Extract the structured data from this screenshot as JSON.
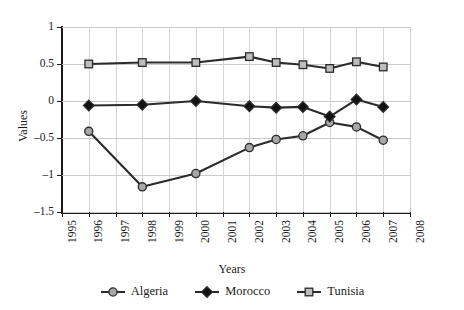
{
  "chart_data": {
    "type": "line",
    "title": "",
    "xlabel": "Years",
    "ylabel": "Values",
    "xlim": [
      1995,
      2008
    ],
    "ylim": [
      -1.5,
      1
    ],
    "yticks": [
      1,
      0.5,
      0,
      -0.5,
      -1,
      -1.5
    ],
    "ytick_labels": [
      "1",
      "0.5",
      "0",
      "–0.5",
      "–1",
      "–1.5"
    ],
    "xticks": [
      1995,
      1996,
      1997,
      1998,
      1999,
      2000,
      2001,
      2002,
      2003,
      2004,
      2005,
      2006,
      2007,
      2008
    ],
    "xtick_labels": [
      "1995",
      "1996",
      "1997",
      "1998",
      "1999",
      "2000",
      "2001",
      "2002",
      "2003",
      "2004",
      "2005",
      "2006",
      "2007",
      "2008"
    ],
    "grid": "both",
    "legend_position": "bottom",
    "series": [
      {
        "name": "Algeria",
        "marker": "circle",
        "color": "#2b2b2b",
        "marker_fill": "#a6a6a6",
        "x": [
          1996,
          1998,
          2000,
          2002,
          2003,
          2004,
          2005,
          2006,
          2007
        ],
        "values": [
          -0.41,
          -1.16,
          -0.98,
          -0.63,
          -0.52,
          -0.47,
          -0.29,
          -0.35,
          -0.53
        ]
      },
      {
        "name": "Morocco",
        "marker": "diamond",
        "color": "#2b2b2b",
        "marker_fill": "#111111",
        "x": [
          1996,
          1998,
          2000,
          2002,
          2003,
          2004,
          2005,
          2006,
          2007
        ],
        "values": [
          -0.06,
          -0.05,
          0.0,
          -0.07,
          -0.09,
          -0.08,
          -0.21,
          0.02,
          -0.08
        ]
      },
      {
        "name": "Tunisia",
        "marker": "square",
        "color": "#2b2b2b",
        "marker_fill": "#bdbdbd",
        "x": [
          1996,
          1998,
          2000,
          2002,
          2003,
          2004,
          2005,
          2006,
          2007
        ],
        "values": [
          0.5,
          0.52,
          0.52,
          0.6,
          0.52,
          0.49,
          0.44,
          0.53,
          0.46
        ]
      }
    ]
  },
  "legend": {
    "items": [
      {
        "label": "Algeria"
      },
      {
        "label": "Morocco"
      },
      {
        "label": "Tunisia"
      }
    ]
  }
}
